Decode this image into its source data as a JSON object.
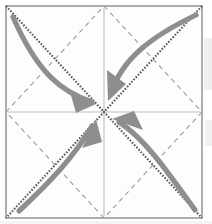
{
  "diagram": {
    "type": "origami-crease-pattern",
    "canvas": {
      "width": 212,
      "height": 224
    },
    "colors": {
      "paper_fill": "#fdfdfd",
      "border": "#8c8c8c",
      "crease_diagonal": "#5a5a5a",
      "crease_diamond": "#9b9b9b",
      "center_guide": "#d2d2d2",
      "arrow": "#8e8e8e",
      "scan_artifact": "#efefef"
    },
    "paper": {
      "name": "square-sheet",
      "left": 6,
      "top": 6,
      "right": 202,
      "bottom": 218,
      "stroke_width": 1.4
    },
    "center_point": {
      "x": 104,
      "y": 112
    },
    "corners": [
      {
        "name": "top-left",
        "x": 6,
        "y": 6
      },
      {
        "name": "top-right",
        "x": 202,
        "y": 6
      },
      {
        "name": "bottom-right",
        "x": 202,
        "y": 218
      },
      {
        "name": "bottom-left",
        "x": 6,
        "y": 218
      }
    ],
    "edge_midpoints": [
      {
        "name": "top-mid",
        "x": 104,
        "y": 6
      },
      {
        "name": "right-mid",
        "x": 202,
        "y": 112
      },
      {
        "name": "bottom-mid",
        "x": 104,
        "y": 218
      },
      {
        "name": "left-mid",
        "x": 6,
        "y": 112
      }
    ],
    "creases": {
      "diagonals": [
        {
          "name": "crease-diagonal-tl-br",
          "x1": 6,
          "y1": 6,
          "x2": 202,
          "y2": 218,
          "style": "dotted",
          "dasharray": "1.6 1.6",
          "width": 2.1
        },
        {
          "name": "crease-diagonal-tr-bl",
          "x1": 202,
          "y1": 6,
          "x2": 6,
          "y2": 218,
          "style": "dotted",
          "dasharray": "1.6 1.6",
          "width": 2.1
        }
      ],
      "diamond": [
        {
          "name": "crease-diamond-top-right",
          "x1": 104,
          "y1": 6,
          "x2": 202,
          "y2": 112
        },
        {
          "name": "crease-diamond-right-bottom",
          "x1": 202,
          "y1": 112,
          "x2": 104,
          "y2": 218
        },
        {
          "name": "crease-diamond-bottom-left",
          "x1": 104,
          "y1": 218,
          "x2": 6,
          "y2": 112
        },
        {
          "name": "crease-diamond-left-top",
          "x1": 6,
          "y1": 112,
          "x2": 104,
          "y2": 6
        }
      ],
      "diamond_style": {
        "dasharray": "5 4",
        "width": 1.1
      },
      "guides": [
        {
          "name": "center-guide-vertical",
          "x1": 104,
          "y1": 6,
          "x2": 104,
          "y2": 218
        },
        {
          "name": "center-guide-horizontal",
          "x1": 6,
          "y1": 112,
          "x2": 202,
          "y2": 112
        }
      ],
      "guide_style": {
        "width": 1.6
      }
    },
    "arrows": [
      {
        "name": "fold-arrow-top-left",
        "from": "top-left",
        "to": "center",
        "path": "M 13 17 C 38 74 62 92 92 102",
        "head": "M 92 102 L 70 93 L 75 112 Z",
        "width": 5.2
      },
      {
        "name": "fold-arrow-top-right",
        "from": "top-right",
        "to": "center",
        "path": "M 196 15 C 150 37 121 60 111 94",
        "head": "M 111 94 L 108 71 L 124 82 Z",
        "width": 5.2
      },
      {
        "name": "fold-arrow-bottom-right",
        "from": "bottom-right",
        "to": "center",
        "path": "M 195 210 C 167 171 145 139 119 122",
        "head": "M 119 122 L 141 128 L 132 112 Z",
        "width": 5.2
      },
      {
        "name": "fold-arrow-bottom-left",
        "from": "bottom-left",
        "to": "center",
        "path": "M 19 211 C 50 182 74 157 92 126",
        "head": "M 92 126 L 85 147 L 101 140 Z",
        "width": 5.2
      }
    ],
    "artifacts": [
      {
        "name": "scan-artifact-right-upper",
        "x": 204,
        "y": 38,
        "width": 8,
        "height": 52
      },
      {
        "name": "scan-artifact-right-lower",
        "x": 205,
        "y": 120,
        "width": 7,
        "height": 26
      }
    ]
  }
}
